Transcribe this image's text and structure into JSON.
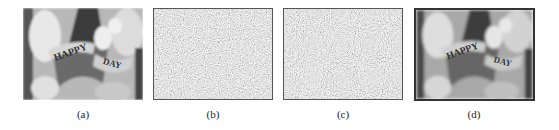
{
  "figure": {
    "panels": [
      {
        "label": "(a)",
        "content": "original grayscale image of 'HAPPY BIRTHDAY' banner with clown figure"
      },
      {
        "label": "(b)",
        "content": "noise-like encrypted image"
      },
      {
        "label": "(c)",
        "content": "noise-like encrypted image"
      },
      {
        "label": "(d)",
        "content": "decrypted grayscale image of 'HAPPY BIRTHDAY' banner"
      }
    ],
    "banner_text_left": "HAPPY",
    "banner_text_right": "DAY"
  }
}
